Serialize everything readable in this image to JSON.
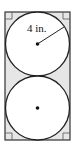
{
  "diagram": {
    "rectangle": {
      "x": 5,
      "y": 12,
      "width": 65,
      "height": 128,
      "fill": "#e6e6e6",
      "stroke": "#333333"
    },
    "circles": [
      {
        "cx": 37.5,
        "cy": 44,
        "r": 32,
        "fill": "#ffffff",
        "stroke": "#222222",
        "has_center_dot": true,
        "has_radius": true
      },
      {
        "cx": 37.5,
        "cy": 108,
        "r": 32,
        "fill": "#ffffff",
        "stroke": "#222222",
        "has_center_dot": true,
        "has_radius": false
      }
    ],
    "radius_label": "4 in.",
    "corner_marks": [
      "top-left",
      "top-right",
      "bottom-left",
      "bottom-right"
    ],
    "corner_mark_size": 7
  }
}
